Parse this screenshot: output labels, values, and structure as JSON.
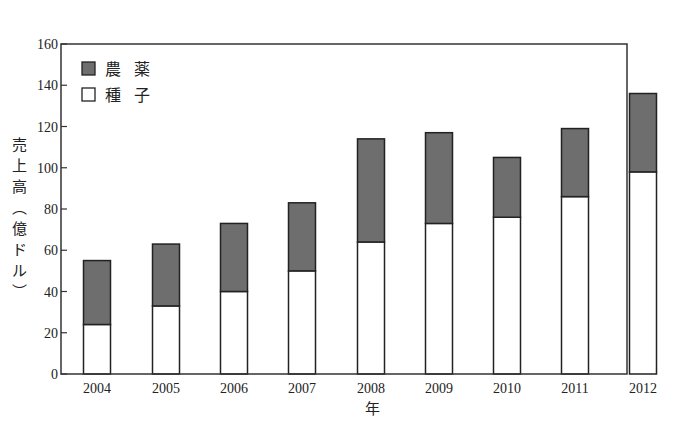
{
  "chart_data": {
    "type": "bar",
    "stacked": true,
    "title": "",
    "xlabel": "年",
    "ylabel": "売上高（億ドル）",
    "ylim": [
      0,
      160
    ],
    "yticks": [
      0,
      20,
      40,
      60,
      80,
      100,
      120,
      140,
      160
    ],
    "grid": false,
    "legend_position": "upper-left",
    "categories": [
      "2004",
      "2005",
      "2006",
      "2007",
      "2008",
      "2009",
      "2010",
      "2011",
      "2012"
    ],
    "series": [
      {
        "name": "種子",
        "color": "#ffffff",
        "values": [
          24,
          33,
          40,
          50,
          64,
          73,
          76,
          86,
          98
        ]
      },
      {
        "name": "農薬",
        "color": "#6e6e6e",
        "values": [
          31,
          30,
          33,
          33,
          50,
          44,
          29,
          33,
          38
        ]
      }
    ],
    "totals": [
      55,
      63,
      73,
      83,
      114,
      117,
      105,
      119,
      136
    ]
  },
  "legend": [
    {
      "label": "農 薬",
      "swatch": "#6e6e6e"
    },
    {
      "label": "種 子",
      "swatch": "#ffffff"
    }
  ],
  "axes": {
    "xlabel": "年",
    "ylabel_chars": [
      "売",
      "上",
      "高",
      "︵",
      "億",
      "ド",
      "ル",
      "︶"
    ]
  }
}
